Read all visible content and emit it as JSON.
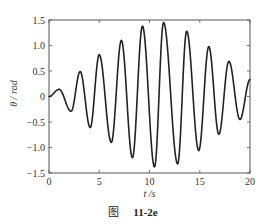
{
  "chart_data": {
    "type": "line",
    "title": "",
    "xlabel": "t /s",
    "ylabel": "θ / rad",
    "xlim": [
      0,
      20
    ],
    "ylim": [
      -1.5,
      1.5
    ],
    "xticks": [
      0,
      5,
      10,
      15,
      20
    ],
    "yticks": [
      -1.5,
      -1.0,
      -0.5,
      0,
      0.5,
      1.0,
      1.5
    ],
    "xtick_labels": [
      "0",
      "5",
      "10",
      "15",
      "20"
    ],
    "ytick_labels": [
      "−1.5",
      "−1.0",
      "−0.5",
      "0",
      "0.5",
      "1.0",
      "1.5"
    ],
    "grid": false,
    "legend": null,
    "series": [
      {
        "name": "theta",
        "color": "#222222",
        "extrema": [
          {
            "t": 0.0,
            "v": 0.0
          },
          {
            "t": 1.0,
            "v": 0.14
          },
          {
            "t": 2.2,
            "v": -0.29
          },
          {
            "t": 3.1,
            "v": 0.49
          },
          {
            "t": 4.1,
            "v": -0.61
          },
          {
            "t": 5.0,
            "v": 0.82
          },
          {
            "t": 6.2,
            "v": -0.9
          },
          {
            "t": 7.2,
            "v": 1.1
          },
          {
            "t": 8.3,
            "v": -1.2
          },
          {
            "t": 9.3,
            "v": 1.38
          },
          {
            "t": 10.5,
            "v": -1.38
          },
          {
            "t": 11.4,
            "v": 1.45
          },
          {
            "t": 12.8,
            "v": -1.32
          },
          {
            "t": 13.7,
            "v": 1.28
          },
          {
            "t": 14.9,
            "v": -1.06
          },
          {
            "t": 15.9,
            "v": 0.98
          },
          {
            "t": 16.9,
            "v": -0.74
          },
          {
            "t": 17.9,
            "v": 0.69
          },
          {
            "t": 19.0,
            "v": -0.45
          },
          {
            "t": 20.0,
            "v": 0.33
          }
        ]
      }
    ]
  },
  "caption": {
    "prefix": "图",
    "number": "11-2e"
  },
  "layout": {
    "plot": {
      "left": 49,
      "right": 250,
      "top": 20,
      "bottom": 173
    },
    "line_color": "#222222",
    "axis_color": "#555555"
  }
}
